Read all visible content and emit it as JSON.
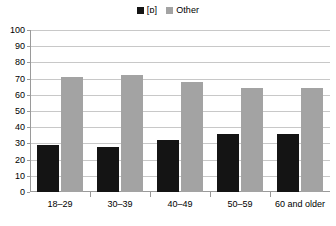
{
  "chart_data": {
    "type": "bar",
    "title": "",
    "subtitle": "",
    "xlabel": "",
    "ylabel": "",
    "categories": [
      "18–29",
      "30–39",
      "40–49",
      "50–59",
      "60 and older"
    ],
    "series": [
      {
        "name": "[ɒ]",
        "color": "#141414",
        "values": [
          29,
          28,
          32,
          36,
          36
        ]
      },
      {
        "name": "Other",
        "color": "#a3a3a3",
        "values": [
          71,
          72,
          68,
          64,
          64
        ]
      }
    ],
    "ylim": [
      0,
      100
    ],
    "ytick_step": 10,
    "yticks": [
      100,
      90,
      80,
      70,
      60,
      50,
      40,
      30,
      20,
      10,
      0
    ],
    "grid": true,
    "grid_axis": "y",
    "legend_position": "top-center",
    "colors": {
      "series_0": "#141414",
      "series_1": "#a3a3a3",
      "gridline": "#c8c8c8",
      "axis": "#9a9a9a",
      "background": "#ffffff",
      "text": "#000000"
    }
  },
  "legend": {
    "entries": [
      {
        "label": "[ɒ]",
        "swatch": "legend-swatch-black"
      },
      {
        "label": "Other",
        "swatch": "legend-swatch-gray"
      }
    ]
  }
}
